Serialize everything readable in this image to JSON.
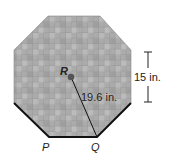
{
  "figure": {
    "shape": "regular octagon (tiled)",
    "center_label": "R",
    "vertex_labels": [
      "P",
      "Q"
    ],
    "radius_label": "19.6 in.",
    "side_label": "15 in.",
    "colors": {
      "fill": "#a8a8a8",
      "tile_grid": "#8f8f8f",
      "edge": "#111111",
      "dot": "#555555"
    }
  }
}
